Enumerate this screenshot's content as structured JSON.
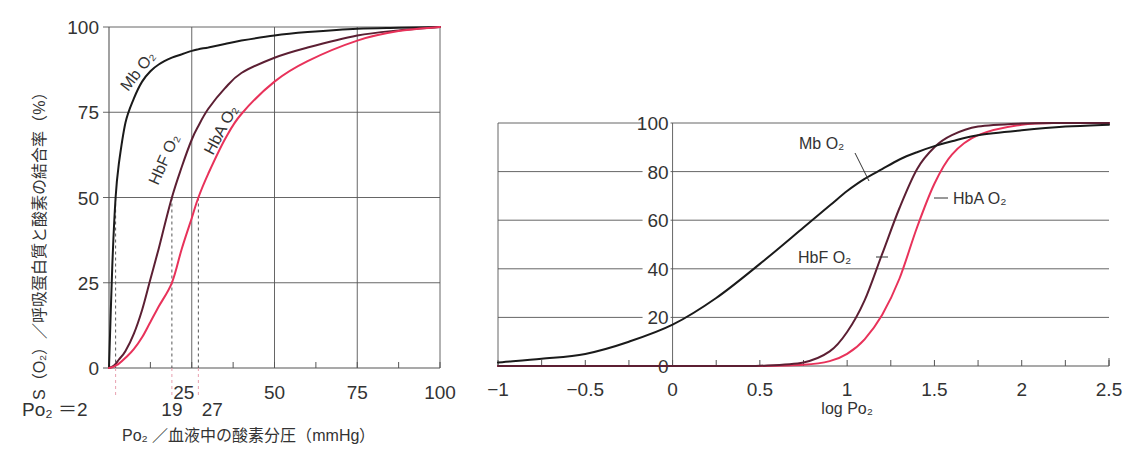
{
  "chart_data": [
    {
      "type": "line",
      "title": "",
      "xlabel": "Po₂ ／血液中の酸素分圧（mmHg）",
      "ylabel": "S（O₂）／呼吸蛋白質と酸素の結合率（%）",
      "xlim": [
        0,
        100
      ],
      "ylim": [
        0,
        100
      ],
      "x_ticks": [
        25,
        50,
        75,
        100
      ],
      "x_tick_labels": [
        "25",
        "50",
        "75",
        "100"
      ],
      "x_minor_tick_step": 12.5,
      "y_ticks": [
        0,
        25,
        50,
        75,
        100
      ],
      "y_tick_labels": [
        "0",
        "25",
        "50",
        "75",
        "100"
      ],
      "grid": true,
      "x": [
        0,
        1,
        2,
        3,
        5,
        7.5,
        10,
        12.5,
        15,
        19,
        22,
        25,
        27,
        30,
        35,
        40,
        50,
        60,
        75,
        87.5,
        100
      ],
      "series": [
        {
          "name": "Mb O₂",
          "label": "Mb O₂",
          "color": "#1a1a1a",
          "values": [
            0,
            30,
            50,
            60,
            72,
            79,
            84,
            87,
            89,
            91,
            92,
            93,
            93.5,
            94,
            95,
            96,
            97.5,
            98.5,
            99.5,
            99.8,
            100
          ]
        },
        {
          "name": "HbF O₂",
          "label": "HbF O₂",
          "color": "#5c1f33",
          "values": [
            0,
            0.4,
            1.2,
            2.5,
            5,
            10,
            17,
            26,
            35,
            50,
            59,
            67,
            71,
            76,
            82,
            86.5,
            91,
            94,
            97.5,
            99,
            100
          ]
        },
        {
          "name": "HbA O₂",
          "label": "HbA O₂",
          "color": "#e8325a",
          "values": [
            0,
            0.2,
            0.7,
            1.3,
            3,
            5.5,
            9,
            13.5,
            18,
            25,
            35,
            44,
            50,
            57,
            67,
            74.5,
            84,
            90,
            96,
            98.8,
            100
          ]
        }
      ],
      "annotations": [
        {
          "text": "Po₂ ＝2",
          "x": 2,
          "type": "drop-line",
          "curve": "Mb O₂",
          "y": 50
        },
        {
          "text": "19",
          "x": 19,
          "type": "drop-line",
          "curve": "HbF O₂",
          "y": 50
        },
        {
          "text": "27",
          "x": 27,
          "type": "drop-line",
          "curve": "HbA O₂",
          "y": 50
        }
      ]
    },
    {
      "type": "line",
      "title": "",
      "xlabel": "log Po₂",
      "ylabel": "",
      "xlim": [
        -1,
        2.5
      ],
      "ylim": [
        0,
        100
      ],
      "x_ticks": [
        -1,
        -0.5,
        0,
        0.5,
        1,
        1.5,
        2,
        2.5
      ],
      "x_tick_labels": [
        "−1",
        "−0.5",
        "0",
        "0.5",
        "1",
        "1.5",
        "2",
        "2.5"
      ],
      "x_minor_tick_step": 0.25,
      "y_ticks": [
        0,
        20,
        40,
        60,
        80,
        100
      ],
      "y_tick_labels": [
        "0",
        "20",
        "40",
        "60",
        "80",
        "100"
      ],
      "grid": true,
      "x": [
        -1,
        -0.75,
        -0.5,
        -0.25,
        0,
        0.25,
        0.5,
        0.75,
        0.9,
        1,
        1.1,
        1.2,
        1.3,
        1.4,
        1.5,
        1.6,
        1.75,
        2,
        2.25,
        2.5
      ],
      "series": [
        {
          "name": "Mb O₂",
          "label": "Mb O₂",
          "color": "#1a1a1a",
          "values": [
            1.5,
            3,
            5,
            10,
            17,
            28,
            42,
            57,
            66,
            72,
            77,
            81,
            85,
            88,
            90.5,
            92.5,
            95,
            97,
            98.5,
            99.3
          ]
        },
        {
          "name": "HbF O₂",
          "label": "HbF O₂",
          "color": "#5c1f33",
          "values": [
            0,
            0,
            0,
            0,
            0,
            0,
            0.1,
            1.5,
            6,
            14,
            27,
            46,
            65,
            81,
            90,
            95,
            98.5,
            99.8,
            100,
            100
          ]
        },
        {
          "name": "HbA O₂",
          "label": "HbA O₂",
          "color": "#e8325a",
          "values": [
            0,
            0,
            0,
            0,
            0,
            0,
            0,
            0.5,
            2,
            5,
            11,
            21,
            36,
            57,
            75,
            87,
            95,
            99.3,
            100,
            100
          ]
        }
      ]
    }
  ]
}
